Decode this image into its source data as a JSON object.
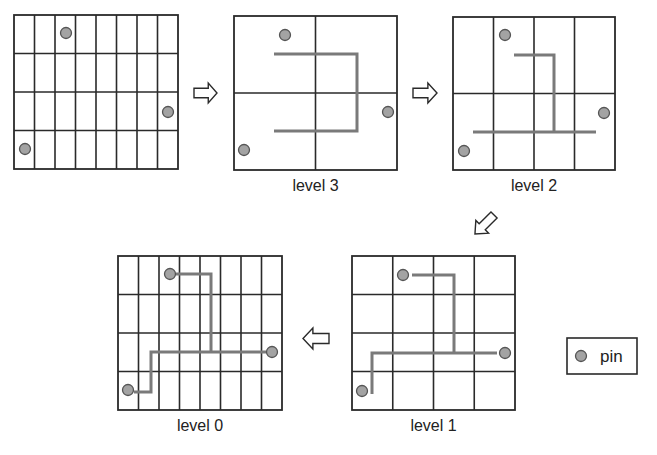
{
  "diagram": {
    "colors": {
      "grid": "#2a2a2a",
      "route": "#7a7a7a",
      "pin_fill": "#a3a3a3",
      "pin_stroke": "#555555",
      "background": "#ffffff"
    },
    "panels": [
      {
        "id": "initial",
        "label": "",
        "box": {
          "x": 14,
          "y": 15,
          "w": 164,
          "h": 154
        },
        "cols": 8,
        "rows": 4,
        "pins": [
          {
            "x": 66,
            "y": 33
          },
          {
            "x": 168,
            "y": 112
          },
          {
            "x": 25,
            "y": 149
          }
        ],
        "routes": []
      },
      {
        "id": "level3",
        "label": "level 3",
        "box": {
          "x": 234,
          "y": 16,
          "w": 163,
          "h": 154
        },
        "cols": 2,
        "rows": 2,
        "pins": [
          {
            "x": 285,
            "y": 35
          },
          {
            "x": 388,
            "y": 112
          },
          {
            "x": 244,
            "y": 150
          }
        ],
        "routes": [
          [
            [
              274,
              54
            ],
            [
              357,
              54
            ],
            [
              357,
              131
            ],
            [
              274,
              131
            ]
          ]
        ]
      },
      {
        "id": "level2",
        "label": "level 2",
        "box": {
          "x": 453,
          "y": 17,
          "w": 162,
          "h": 153
        },
        "cols": 4,
        "rows": 2,
        "pins": [
          {
            "x": 505,
            "y": 35
          },
          {
            "x": 604,
            "y": 113
          },
          {
            "x": 464,
            "y": 151
          }
        ],
        "routes": [
          [
            [
              514,
              55
            ],
            [
              554,
              55
            ],
            [
              554,
              132
            ]
          ],
          [
            [
              473,
              132
            ],
            [
              596,
              132
            ]
          ]
        ]
      },
      {
        "id": "level1",
        "label": "level 1",
        "box": {
          "x": 352,
          "y": 256,
          "w": 163,
          "h": 154
        },
        "cols": 4,
        "rows": 4,
        "pins": [
          {
            "x": 403,
            "y": 275
          },
          {
            "x": 505,
            "y": 353
          },
          {
            "x": 362,
            "y": 391
          }
        ],
        "routes": [
          [
            [
              412,
              275
            ],
            [
              454,
              275
            ],
            [
              454,
              353
            ]
          ],
          [
            [
              497,
              353
            ],
            [
              372,
              353
            ],
            [
              372,
              394
            ]
          ]
        ]
      },
      {
        "id": "level0",
        "label": "level 0",
        "box": {
          "x": 118,
          "y": 256,
          "w": 164,
          "h": 154
        },
        "cols": 8,
        "rows": 4,
        "pins": [
          {
            "x": 170,
            "y": 274
          },
          {
            "x": 272,
            "y": 352
          },
          {
            "x": 128,
            "y": 390
          }
        ],
        "routes": [
          [
            [
              176,
              274
            ],
            [
              211,
              274
            ],
            [
              211,
              352
            ]
          ],
          [
            [
              266,
              352
            ],
            [
              151,
              352
            ],
            [
              151,
              392
            ],
            [
              134,
              392
            ]
          ]
        ]
      }
    ],
    "arrows": [
      {
        "id": "arrow-initial-to-level3",
        "direction": "right",
        "x": 194,
        "y": 83,
        "w": 23,
        "h": 20
      },
      {
        "id": "arrow-level3-to-level2",
        "direction": "right",
        "x": 413,
        "y": 83,
        "w": 24,
        "h": 20
      },
      {
        "id": "arrow-level2-to-level1",
        "direction": "down-left",
        "x": 472,
        "y": 212,
        "w": 25,
        "h": 25
      },
      {
        "id": "arrow-level1-to-level0",
        "direction": "left",
        "x": 303,
        "y": 328,
        "w": 26,
        "h": 21
      }
    ],
    "legend": {
      "box": {
        "x": 567,
        "y": 338,
        "w": 70,
        "h": 36
      },
      "items": [
        {
          "symbol": "pin-icon",
          "label": "pin"
        }
      ]
    }
  }
}
